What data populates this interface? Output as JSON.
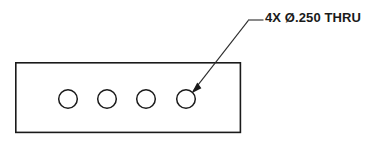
{
  "drawing": {
    "title": "Plate with four through holes",
    "background_color": "#ffffff",
    "line_color": "#1a1a1a",
    "leader_color": "#2b2b2b",
    "canvas": {
      "width": 377,
      "height": 145
    },
    "part": {
      "name": "rectangular-plate",
      "shape": "rectangle",
      "x": 15,
      "y": 62,
      "width": 226,
      "height": 71
    },
    "holes": {
      "count": 4,
      "radius": 9.5,
      "center_y": 99,
      "centers_x": [
        68,
        107,
        146,
        186
      ],
      "items": [
        {
          "label": "hole-1",
          "cx": 68,
          "cy": 99,
          "r": 9.5
        },
        {
          "label": "hole-2",
          "cx": 107,
          "cy": 99,
          "r": 9.5
        },
        {
          "label": "hole-3",
          "cx": 146,
          "cy": 99,
          "r": 9.5
        },
        {
          "label": "hole-4",
          "cx": 186,
          "cy": 99,
          "r": 9.5
        }
      ]
    },
    "leader": {
      "name": "hole-callout-leader",
      "shoulder_start_x": 248,
      "shoulder_end_x": 263,
      "shoulder_y": 20,
      "elbow_x": 248,
      "elbow_y": 20,
      "arrow_tip_x": 192,
      "arrow_tip_y": 92,
      "path": "M 263 20 L 248 20 L 192 92",
      "arrowhead_points": "192,92 201,87 197,82"
    },
    "annotation": {
      "name": "hole-callout-note",
      "text": "4X Ø.250 THRU",
      "quantity": "4X",
      "diameter_symbol": "Ø",
      "diameter_value": ".250",
      "modifier": "THRU",
      "x": 265,
      "y": 10,
      "font_size": 13
    }
  }
}
